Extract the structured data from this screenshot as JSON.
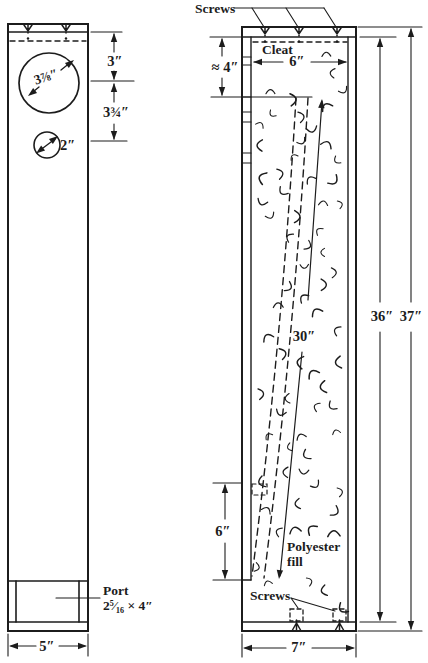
{
  "figure": {
    "kind": "speaker-cabinet-construction-diagram",
    "colors": {
      "ink": "#1c1c1c",
      "paper": "#ffffff"
    },
    "front_view": {
      "width_label": "5″",
      "woofer_diameter_label": "3⅞″",
      "tweeter_diameter_label": "2″",
      "woofer_offset_label": "3″",
      "driver_spacing_label": "3¾″",
      "port_label": "Port",
      "port_size_label": "2⁵⁄₁₆ × 4″"
    },
    "section_view": {
      "screws_top_label": "Screws",
      "cleat_label": "Cleat",
      "top_clearance_label": "≈ 4″",
      "inner_width_label": "6″",
      "tube_length_label": "30″",
      "port_section_height_label": "6″",
      "fill_label_line1": "Polyester",
      "fill_label_line2": "fill",
      "screws_bottom_label": "Screws",
      "inner_height_label": "36″",
      "outer_height_label": "37″",
      "width_label": "7″"
    }
  }
}
